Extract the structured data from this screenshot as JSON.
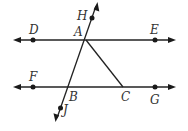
{
  "diagram": {
    "stroke_color": "#222222",
    "labels": {
      "D": "D",
      "E": "E",
      "H": "H",
      "A": "A",
      "F": "F",
      "B": "B",
      "C": "C",
      "G": "G",
      "J": "J"
    },
    "lines": [
      {
        "name": "line DE",
        "points": [
          "D",
          "A",
          "E"
        ],
        "arrows": "both"
      },
      {
        "name": "line FG",
        "points": [
          "F",
          "B",
          "C",
          "G"
        ],
        "arrows": "both"
      },
      {
        "name": "transversal HJ",
        "points": [
          "H",
          "A",
          "B",
          "J"
        ],
        "arrows": "both"
      },
      {
        "name": "segment AC",
        "points": [
          "A",
          "C"
        ],
        "arrows": "none"
      }
    ],
    "dots": [
      "D",
      "E",
      "F",
      "G",
      "H",
      "J"
    ]
  }
}
